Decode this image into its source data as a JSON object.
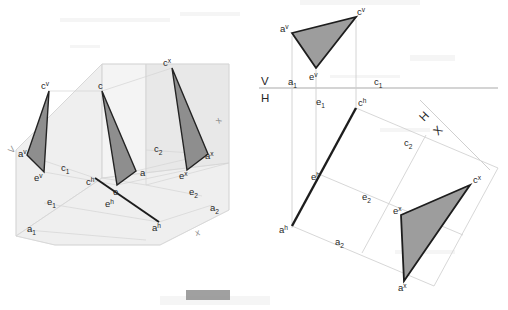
{
  "figure": {
    "background_color": "#ffffff",
    "ink_color": "#262626",
    "triangle_fill": "#9b9b9b",
    "plane_fill": "#ebebeb",
    "plane_line_color": "#d2d2d2",
    "guide_line_color": "#cfcfcf",
    "axis_line_color": "#b3b3b3"
  },
  "left_diagram": {
    "name": "pictorial-3d-view",
    "caption_labels": {
      "plane_v": "V",
      "plane_h": "x",
      "plane_x": "x"
    },
    "vertices": [
      {
        "id": "cv",
        "base": "c",
        "sup": "v",
        "x": 49,
        "y": 91,
        "label_x": 41,
        "label_y": 89
      },
      {
        "id": "c",
        "base": "c",
        "sup": "",
        "x": 102,
        "y": 91,
        "label_x": 98,
        "label_y": 89
      },
      {
        "id": "cx",
        "base": "c",
        "sup": "x",
        "x": 172,
        "y": 68,
        "label_x": 163,
        "label_y": 66
      },
      {
        "id": "av",
        "base": "a",
        "sup": "v",
        "x": 27,
        "y": 155,
        "label_x": 18,
        "label_y": 157
      },
      {
        "id": "ev",
        "base": "e",
        "sup": "v",
        "x": 44,
        "y": 172,
        "label_x": 36,
        "label_y": 181
      },
      {
        "id": "a",
        "base": "a",
        "sup": "",
        "x": 136,
        "y": 171,
        "label_x": 139,
        "label_y": 175
      },
      {
        "id": "e",
        "base": "e",
        "sup": "",
        "x": 117,
        "y": 185,
        "label_x": 113,
        "label_y": 194
      },
      {
        "id": "ax",
        "base": "a",
        "sup": "x",
        "x": 208,
        "y": 154,
        "label_x": 205,
        "label_y": 158
      },
      {
        "id": "ex",
        "base": "e",
        "sup": "x",
        "x": 187,
        "y": 170,
        "label_x": 180,
        "label_y": 178
      },
      {
        "id": "ch",
        "base": "c",
        "sup": "h",
        "x": 95,
        "y": 178,
        "label_x": 88,
        "label_y": 185
      },
      {
        "id": "ah",
        "base": "a",
        "sup": "h",
        "x": 159,
        "y": 222,
        "label_x": 153,
        "label_y": 230
      }
    ],
    "grid_labels": [
      {
        "id": "c1",
        "base": "c",
        "sub": "1",
        "label_x": 62,
        "label_y": 171
      },
      {
        "id": "e1",
        "base": "e",
        "sub": "1",
        "label_x": 48,
        "label_y": 204
      },
      {
        "id": "a1",
        "base": "a",
        "sub": "1",
        "label_x": 28,
        "label_y": 231
      },
      {
        "id": "c2",
        "base": "c",
        "sub": "2",
        "label_x": 155,
        "label_y": 151
      },
      {
        "id": "e2",
        "base": "e",
        "sub": "2",
        "label_x": 190,
        "label_y": 194
      },
      {
        "id": "a2",
        "base": "a",
        "sub": "2",
        "label_x": 211,
        "label_y": 210
      },
      {
        "id": "eh",
        "base": "e",
        "sup": "h",
        "label_x": 106,
        "label_y": 206
      }
    ]
  },
  "right_diagram": {
    "name": "orthographic-multiview",
    "axis_labels": {
      "v": "V",
      "h": "H",
      "h_rotated": "H",
      "x_rotated": "X"
    },
    "vertices": [
      {
        "id": "av",
        "base": "a",
        "sup": "v",
        "x": 292,
        "y": 33,
        "label_x": 281,
        "label_y": 31
      },
      {
        "id": "cv",
        "base": "c",
        "sup": "v",
        "x": 356,
        "y": 17,
        "label_x": 357,
        "label_y": 15
      },
      {
        "id": "ev",
        "base": "e",
        "sup": "v",
        "x": 316,
        "y": 68,
        "label_x": 310,
        "label_y": 79
      },
      {
        "id": "ch",
        "base": "c",
        "sup": "h",
        "x": 356,
        "y": 108,
        "label_x": 358,
        "label_y": 106
      },
      {
        "id": "ah",
        "base": "a",
        "sup": "h",
        "x": 292,
        "y": 226,
        "label_x": 281,
        "label_y": 232
      },
      {
        "id": "eh",
        "base": "e",
        "sup": "h",
        "x": 321,
        "y": 175,
        "label_x": 312,
        "label_y": 179
      },
      {
        "id": "cx",
        "base": "c",
        "sup": "x",
        "x": 470,
        "y": 185,
        "label_x": 473,
        "label_y": 183
      },
      {
        "id": "ex",
        "base": "e",
        "sup": "x",
        "x": 401,
        "y": 215,
        "label_x": 394,
        "label_y": 213
      },
      {
        "id": "ax",
        "base": "a",
        "sup": "x",
        "x": 404,
        "y": 281,
        "label_x": 399,
        "label_y": 290
      }
    ],
    "grid_labels": [
      {
        "id": "a1",
        "base": "a",
        "sub": "1",
        "label_x": 291,
        "label_y": 90
      },
      {
        "id": "c1",
        "base": "c",
        "sub": "1",
        "label_x": 377,
        "label_y": 90
      },
      {
        "id": "e1",
        "base": "e",
        "sub": "1",
        "label_x": 318,
        "label_y": 107
      },
      {
        "id": "c2",
        "base": "c",
        "sub": "2",
        "label_x": 406,
        "label_y": 145
      },
      {
        "id": "e2",
        "base": "e",
        "sub": "2",
        "label_x": 364,
        "label_y": 199
      },
      {
        "id": "a2",
        "base": "a",
        "sub": "2",
        "label_x": 337,
        "label_y": 244
      }
    ]
  }
}
